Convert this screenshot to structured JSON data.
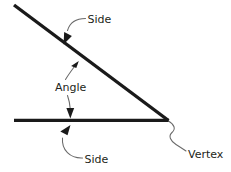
{
  "diagram": {
    "type": "geometry-angle-diagram",
    "background_color": "#ffffff",
    "line_color": "#1a1a1a",
    "leader_color": "#6a6a6a",
    "text_color": "#231f20",
    "labels": {
      "side_top": "Side",
      "angle": "Angle",
      "side_bottom": "Side",
      "vertex": "Vertex"
    },
    "geometry": {
      "vertex_point": [
        168,
        120
      ],
      "ray_upper_start": [
        14,
        5
      ],
      "ray_lower_start": [
        14,
        120
      ],
      "stroke_width": 3.4
    }
  }
}
